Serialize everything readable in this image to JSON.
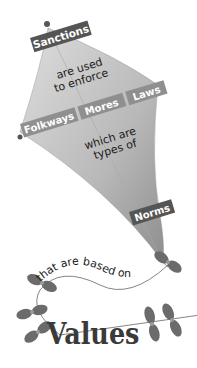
{
  "diagram": {
    "type": "kite concept map",
    "top_label": "Sanctions",
    "connector_1": [
      "are used",
      "to enforce"
    ],
    "middle_labels": [
      "Folkways",
      "Mores",
      "Laws"
    ],
    "connector_2": [
      "which are",
      "types of"
    ],
    "bottom_label": "Norms",
    "tail_connector": "that are based on",
    "tail_label": "Values",
    "colors": {
      "kite_light": "#d6d6d6",
      "kite_dark": "#9a9a9a",
      "label_dark": "#555555",
      "label_mid": "#8f8f8f",
      "bow": "#6b6b6b"
    }
  }
}
